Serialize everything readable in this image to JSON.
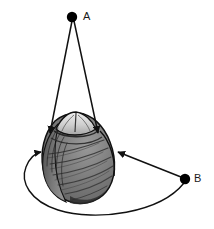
{
  "figure": {
    "type": "scientific-diagram",
    "background_color": "#ffffff",
    "subject": {
      "name": "insect-larva-dorsal-view",
      "description": "Shaded dorsal view of a segmented insect larva / pupa with a pointed light-colored anterior head region and dark gray striated body segments",
      "body_fill_dark": "#6f6f6f",
      "body_fill_mid": "#8a8a8a",
      "body_fill_light": "#d9d9d9",
      "outline_color": "#111111"
    },
    "points": [
      {
        "id": "A",
        "label": "A",
        "marker": "filled-circle",
        "color": "#000000",
        "x": 72,
        "y": 17
      },
      {
        "id": "B",
        "label": "B",
        "marker": "filled-circle",
        "color": "#000000",
        "x": 185,
        "y": 179
      }
    ],
    "arrows": [
      {
        "name": "arrow-a-left",
        "from": "A",
        "to": "larva-left-shoulder",
        "style": "straight",
        "head": "end",
        "color": "#111111"
      },
      {
        "name": "arrow-a-right",
        "from": "A",
        "to": "larva-right-shoulder",
        "style": "straight",
        "head": "end",
        "color": "#111111"
      },
      {
        "name": "arrow-b-direct",
        "from": "B",
        "to": "larva-right-flank",
        "style": "straight",
        "head": "end",
        "color": "#111111"
      },
      {
        "name": "arrow-b-curved",
        "from": "B",
        "to": "larva-left-flank",
        "style": "curved-sweep-below",
        "head": "end",
        "color": "#111111"
      }
    ]
  }
}
